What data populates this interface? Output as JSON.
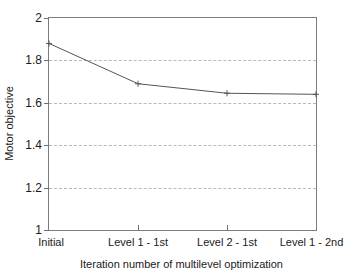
{
  "chart_data": {
    "type": "line",
    "title": "",
    "xlabel": "Iteration number of multilevel optimization",
    "ylabel": "Motor objective",
    "categories": [
      "Initial",
      "Level 1 - 1st",
      "Level 2 - 1st",
      "Level 1 - 2nd"
    ],
    "values": [
      1.88,
      1.69,
      1.645,
      1.64
    ],
    "series": [
      {
        "name": "Motor objective",
        "values": [
          1.88,
          1.69,
          1.645,
          1.64
        ]
      }
    ],
    "ylim": [
      1,
      2
    ],
    "yticks": [
      1,
      1.2,
      1.4,
      1.6,
      1.8,
      2
    ],
    "ytick_labels": [
      "1",
      "1.2",
      "1.4",
      "1.6",
      "1.8",
      "2"
    ],
    "xticks": [
      0,
      1,
      2,
      3
    ],
    "xtick_labels": [
      "Initial",
      "Level 1 - 1st",
      "Level 2 - 1st",
      "Level 1 - 2nd"
    ],
    "grid": "horizontal-dashed",
    "legend": "none",
    "marker": "plus",
    "line_color": "#555555",
    "grid_color": "#b9b9b9",
    "axis_color": "#7c7c7c",
    "background_color": "#ffffff"
  }
}
